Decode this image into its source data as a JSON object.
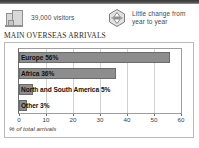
{
  "stats": [
    {
      "icon": "building-icon",
      "text": "39,000 visitors",
      "lines": [
        "39,000 visitors"
      ]
    },
    {
      "icon": "little-change-hexagon-icon",
      "text": "Little change from year to year",
      "lines": [
        "Little change from",
        "year to year"
      ]
    }
  ],
  "chart_title": "MAIN OVERSEAS ARRIVALS",
  "chart_data": {
    "type": "bar",
    "orientation": "horizontal",
    "title": "MAIN OVERSEAS ARRIVALS",
    "xlabel": "% of total arrivals",
    "ylabel": "",
    "categories": [
      "Europe",
      "Africa",
      "North and South America",
      "Other"
    ],
    "values": [
      56,
      36,
      5,
      3
    ],
    "bar_labels": [
      "Europe 56%",
      "Africa 36%",
      "North and South America 5%",
      "Other 3%"
    ],
    "xlim": [
      0,
      60
    ],
    "xticks": [
      0,
      10,
      20,
      30,
      40,
      50,
      60
    ],
    "xtick_labels": [
      "0",
      "10",
      "20",
      "30",
      "40",
      "50",
      "60"
    ],
    "grid": true,
    "legend": false,
    "bar_color": "#8d8d8d",
    "bar_border_color": "#6b6b6b"
  },
  "colors": {
    "bar": "#8d8d8d",
    "bar_border": "#6b6b6b",
    "grid": "#d2d2d2",
    "panel_border": "#b9b9b9",
    "text": "#111111",
    "muted_text": "#4a4a4a"
  }
}
